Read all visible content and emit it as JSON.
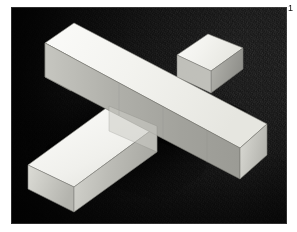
{
  "figure": {
    "number_label": "1",
    "caption": ""
  },
  "photo": {
    "frame": {
      "left": 11,
      "top": 7,
      "width": 276,
      "height": 217
    },
    "background": {
      "name": "dark-gray-carpet",
      "base_color": "#4f4f4f",
      "highlight_color": "#6a6a6a",
      "shadow_color": "#141414",
      "texture": "speckled carpet fiber"
    },
    "object": {
      "name": "white-cross-beams",
      "description": "Two rectangular prisms intersecting to form a cross, viewed in three-quarter perspective",
      "material_color": "#f4f4f1",
      "faces": {
        "top_color": "#f3f3f0",
        "top_shaded_color": "#e4e4de",
        "front_color": "#b8b8b2",
        "front_dark_color": "#9a9a95",
        "end_cap_color": "#cfcfc9",
        "end_cap_dark_color": "#a6a6a0",
        "edge_line_color": "#7d7d78"
      },
      "cast_shadow_color": "#0d0d0d"
    }
  }
}
